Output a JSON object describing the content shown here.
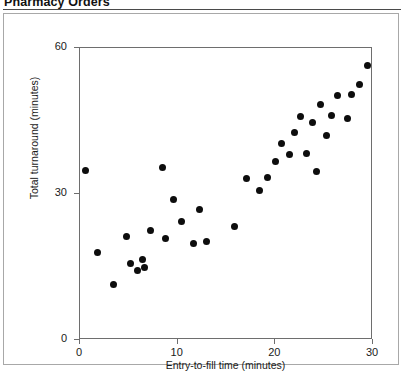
{
  "title": "Pharmacy Orders",
  "chart_data": {
    "type": "scatter",
    "title": "Pharmacy Orders",
    "xlabel": "Entry-to-fill time (minutes)",
    "ylabel": "Total turnaround (minutes)",
    "xlim": [
      0,
      30
    ],
    "ylim": [
      0,
      60
    ],
    "xticks": [
      0,
      10,
      20,
      30
    ],
    "yticks": [
      0,
      30,
      60
    ],
    "xticklabels": [
      "0",
      "10",
      "20",
      "30"
    ],
    "yticklabels": [
      "0",
      "30",
      "60"
    ],
    "grid": false,
    "legend": null,
    "marker": "filled-circle",
    "marker_color": "#0d0d0d",
    "points": [
      {
        "x": 0.6,
        "y": 34.8
      },
      {
        "x": 1.8,
        "y": 18.0
      },
      {
        "x": 3.4,
        "y": 11.4
      },
      {
        "x": 4.8,
        "y": 21.2
      },
      {
        "x": 5.2,
        "y": 15.8
      },
      {
        "x": 5.9,
        "y": 14.2
      },
      {
        "x": 6.4,
        "y": 16.6
      },
      {
        "x": 6.6,
        "y": 15.0
      },
      {
        "x": 7.2,
        "y": 22.4
      },
      {
        "x": 8.4,
        "y": 35.5
      },
      {
        "x": 8.8,
        "y": 20.8
      },
      {
        "x": 9.6,
        "y": 28.8
      },
      {
        "x": 10.4,
        "y": 24.4
      },
      {
        "x": 11.6,
        "y": 19.8
      },
      {
        "x": 12.2,
        "y": 26.8
      },
      {
        "x": 13.0,
        "y": 20.2
      },
      {
        "x": 15.8,
        "y": 23.4
      },
      {
        "x": 17.0,
        "y": 33.2
      },
      {
        "x": 18.4,
        "y": 30.8
      },
      {
        "x": 19.2,
        "y": 33.4
      },
      {
        "x": 20.0,
        "y": 36.6
      },
      {
        "x": 20.6,
        "y": 40.4
      },
      {
        "x": 21.4,
        "y": 38.2
      },
      {
        "x": 22.0,
        "y": 42.6
      },
      {
        "x": 22.6,
        "y": 46.0
      },
      {
        "x": 23.2,
        "y": 38.4
      },
      {
        "x": 23.8,
        "y": 44.6
      },
      {
        "x": 24.2,
        "y": 34.6
      },
      {
        "x": 24.6,
        "y": 48.4
      },
      {
        "x": 25.2,
        "y": 42.0
      },
      {
        "x": 25.8,
        "y": 46.2
      },
      {
        "x": 26.4,
        "y": 50.2
      },
      {
        "x": 27.4,
        "y": 45.6
      },
      {
        "x": 27.8,
        "y": 50.4
      },
      {
        "x": 28.6,
        "y": 52.6
      },
      {
        "x": 29.4,
        "y": 56.4
      }
    ]
  }
}
